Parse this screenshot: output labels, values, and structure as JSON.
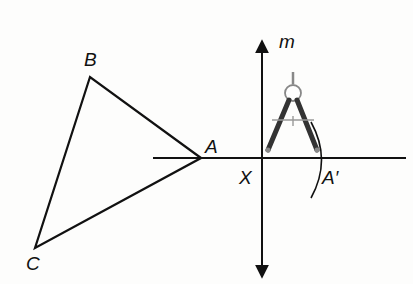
{
  "figure": {
    "labels": {
      "A": "A",
      "B": "B",
      "C": "C",
      "X": "X",
      "A_prime": "A′",
      "m": "m"
    },
    "triangle": {
      "vertices": {
        "A": [
          201,
          158
        ],
        "B": [
          90,
          77
        ],
        "C": [
          35,
          248
        ]
      }
    },
    "horizontal_line": {
      "x1": 153,
      "x2": 406,
      "y": 158
    },
    "line_m": {
      "x": 262,
      "y_top": 40,
      "y_bottom": 280,
      "arrows": "both"
    },
    "compass": {
      "apex": [
        292,
        93
      ],
      "left_tip": [
        267,
        152
      ],
      "right_tip": [
        317,
        152
      ]
    },
    "arc": {
      "center": [
        262,
        158
      ],
      "radius": 61
    },
    "colors": {
      "stroke": "#111111",
      "compass": "#3a3a3a",
      "background": "#fdfdfc"
    }
  }
}
